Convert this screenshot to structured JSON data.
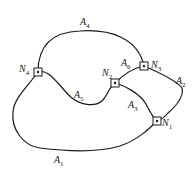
{
  "diagram": {
    "type": "graph",
    "nodes": [
      {
        "id": "N1",
        "label": "N",
        "sub": "1",
        "x": 157,
        "y": 121,
        "lx": 162,
        "ly": 118
      },
      {
        "id": "N2",
        "label": "N",
        "sub": "2",
        "x": 115,
        "y": 83,
        "lx": 102,
        "ly": 68
      },
      {
        "id": "N3",
        "label": "N",
        "sub": "3",
        "x": 144,
        "y": 66,
        "lx": 151,
        "ly": 60
      },
      {
        "id": "N4",
        "label": "N",
        "sub": "4",
        "x": 38,
        "y": 72,
        "lx": 19,
        "ly": 64
      }
    ],
    "edges": [
      {
        "id": "A1",
        "label": "A",
        "sub": "1",
        "from": "N4",
        "to": "N1",
        "lx": 54,
        "ly": 155
      },
      {
        "id": "A2",
        "label": "A",
        "sub": "2",
        "from": "N3",
        "to": "N1",
        "lx": 176,
        "ly": 76
      },
      {
        "id": "A3",
        "label": "A",
        "sub": "3",
        "from": "N2",
        "to": "N1",
        "lx": 128,
        "ly": 100
      },
      {
        "id": "A4",
        "label": "A",
        "sub": "4",
        "from": "N4",
        "to": "N3",
        "lx": 80,
        "ly": 17
      },
      {
        "id": "A5",
        "label": "A",
        "sub": "5",
        "from": "N4",
        "to": "N2",
        "lx": 74,
        "ly": 90
      },
      {
        "id": "A6",
        "label": "A",
        "sub": "6",
        "from": "N2",
        "to": "N3",
        "lx": 121,
        "ly": 58
      }
    ],
    "colors": {
      "stroke": "#1a1a1a",
      "background": "#ffffff"
    }
  }
}
